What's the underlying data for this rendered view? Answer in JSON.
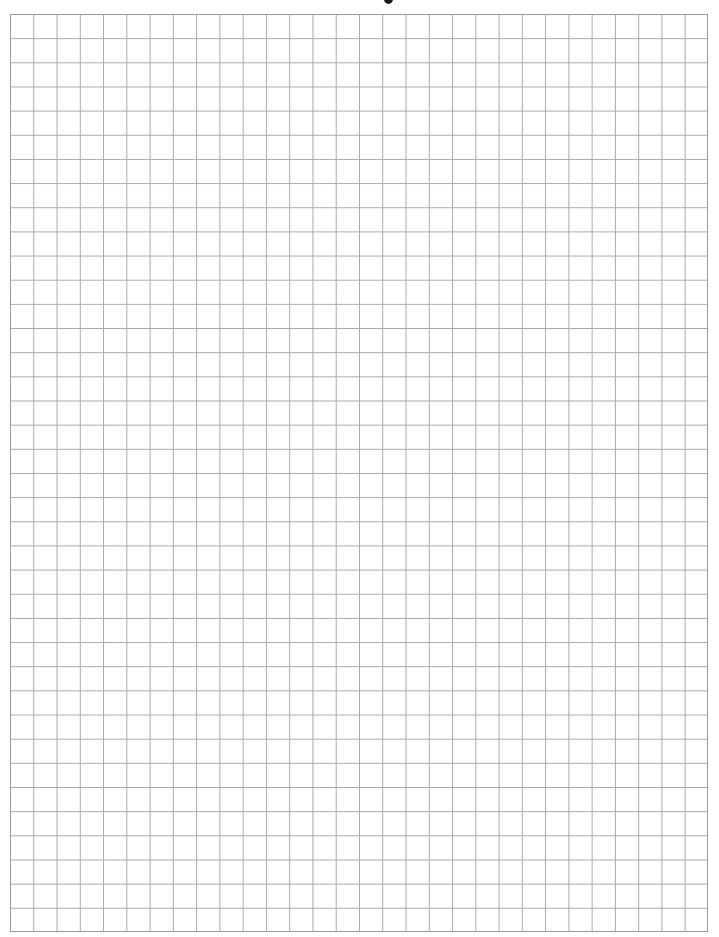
{
  "page": {
    "type": "graph-paper",
    "background_color": "#ffffff",
    "line_color": "#a9a9a9",
    "border_color": "#9a9a9a"
  },
  "grid": {
    "columns": 30,
    "rows": 38,
    "left": 10,
    "top": 14,
    "width": 698,
    "height": 918,
    "cell_width": 23.27,
    "cell_height": 24.16
  },
  "header": {
    "partial_glyph": "cut-off descender"
  }
}
